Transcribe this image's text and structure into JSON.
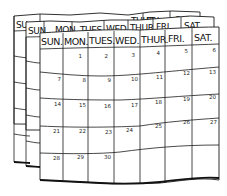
{
  "illustration": {
    "subject": "hand-drawn wall calendar with stacked pages",
    "colors": {
      "ink": "#1a1a1a",
      "paper": "#ffffff"
    }
  },
  "back_page_2": {
    "headers": [
      "SU",
      "",
      "",
      "THUR",
      "FRI",
      "SAT"
    ]
  },
  "back_page_1": {
    "headers": [
      "SUN",
      "MON",
      "TUES",
      "WED",
      "THUR",
      "FRI.",
      "SAT."
    ]
  },
  "front_page": {
    "headers": [
      "SUN.",
      "MON.",
      "TUES.",
      "WED.",
      "THUR.",
      "FRI.",
      "SAT."
    ],
    "weeks": [
      [
        "",
        "1",
        "2",
        "3",
        "4",
        "5",
        "6"
      ],
      [
        "7",
        "8",
        "9",
        "10",
        "11",
        "12",
        "13"
      ],
      [
        "14",
        "15",
        "16",
        "17",
        "18",
        "19",
        "20"
      ],
      [
        "21",
        "22",
        "23",
        "24",
        "25",
        "26",
        "27"
      ],
      [
        "28",
        "29",
        "30",
        "",
        "",
        "",
        ""
      ]
    ]
  }
}
